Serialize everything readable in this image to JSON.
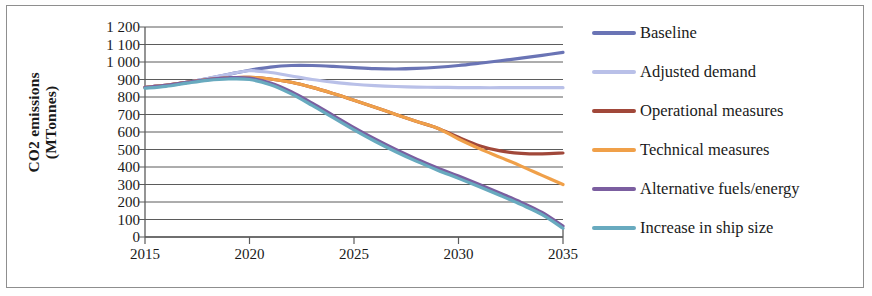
{
  "figure": {
    "border_color": "#8e8e8e",
    "background": "#ffffff"
  },
  "axes": {
    "y_title": "CO2 emissions\n(MTonnes)",
    "y_ticks": [
      "1 200",
      "1 100",
      "1 000",
      "900",
      "800",
      "700",
      "600",
      "500",
      "400",
      "300",
      "200",
      "100",
      "0"
    ],
    "x_ticks": [
      "2015",
      "2020",
      "2025",
      "2030",
      "2035"
    ]
  },
  "legend": {
    "items": [
      {
        "label": "Baseline",
        "color": "#6a74b5"
      },
      {
        "label": "Adjusted demand",
        "color": "#b9c0e8"
      },
      {
        "label": "Operational measures",
        "color": "#a1483a"
      },
      {
        "label": "Technical measures",
        "color": "#f0a049"
      },
      {
        "label": "Alternative fuels/energy",
        "color": "#7b5ea0"
      },
      {
        "label": "Increase in ship size",
        "color": "#68aabf"
      }
    ]
  },
  "chart_data": {
    "type": "line",
    "title": "",
    "xlabel": "",
    "ylabel": "CO2 emissions (MTonnes)",
    "xlim": [
      2015,
      2035
    ],
    "ylim": [
      0,
      1200
    ],
    "ytick_step": 100,
    "grid": true,
    "legend_position": "right",
    "x": [
      2015,
      2016,
      2017,
      2018,
      2019,
      2020,
      2021,
      2022,
      2023,
      2024,
      2025,
      2026,
      2027,
      2028,
      2029,
      2030,
      2031,
      2032,
      2033,
      2034,
      2035
    ],
    "series": [
      {
        "name": "Baseline",
        "color": "#6a74b5",
        "values": [
          855,
          866,
          884,
          906,
          930,
          953,
          971,
          980,
          980,
          975,
          968,
          962,
          960,
          963,
          970,
          980,
          993,
          1007,
          1022,
          1038,
          1055
        ]
      },
      {
        "name": "Adjusted demand",
        "color": "#b9c0e8",
        "values": [
          855,
          866,
          884,
          906,
          930,
          950,
          940,
          920,
          900,
          885,
          873,
          865,
          860,
          857,
          855,
          854,
          853,
          853,
          853,
          853,
          853
        ]
      },
      {
        "name": "Operational measures",
        "color": "#a1483a",
        "values": [
          855,
          866,
          884,
          900,
          910,
          912,
          903,
          884,
          855,
          820,
          782,
          742,
          700,
          660,
          622,
          570,
          522,
          492,
          478,
          475,
          480
        ]
      },
      {
        "name": "Technical measures",
        "color": "#f0a049",
        "values": [
          855,
          866,
          884,
          900,
          910,
          912,
          903,
          884,
          855,
          820,
          782,
          742,
          700,
          660,
          622,
          560,
          505,
          455,
          405,
          352,
          300
        ]
      },
      {
        "name": "Alternative fuels/energy",
        "color": "#7b5ea0",
        "values": [
          855,
          866,
          884,
          900,
          910,
          908,
          880,
          830,
          765,
          695,
          625,
          560,
          500,
          445,
          395,
          348,
          300,
          250,
          198,
          140,
          62
        ]
      },
      {
        "name": "Increase in ship size",
        "color": "#68aabf",
        "values": [
          850,
          861,
          879,
          895,
          903,
          900,
          870,
          818,
          752,
          682,
          612,
          547,
          487,
          432,
          382,
          335,
          287,
          237,
          185,
          128,
          50
        ]
      }
    ]
  }
}
